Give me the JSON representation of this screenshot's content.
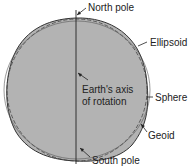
{
  "diagram": {
    "labels": {
      "north_pole": "North pole",
      "ellipsoid": "Ellipsoid",
      "axis_line1": "Earth's axis",
      "axis_line2": "of rotation",
      "sphere": "Sphere",
      "geoid": "Geoid",
      "south_pole": "South pole"
    },
    "colors": {
      "fill": "#b3b3b3",
      "stroke": "#333333",
      "background": "#ffffff"
    }
  }
}
